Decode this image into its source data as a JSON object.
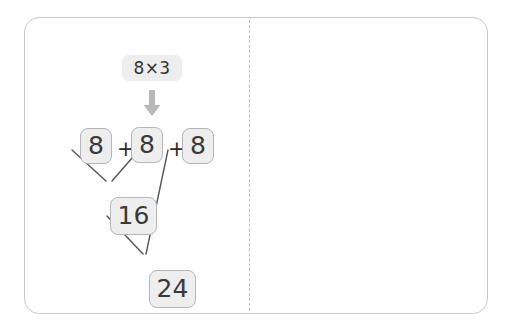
{
  "figure": {
    "divider_style": "dashed"
  },
  "colors": {
    "card_border": "#c9c9c9",
    "divider": "#bdbdbd",
    "chip_fill": "#eeeeee",
    "chip_border": "#b5b5b5",
    "badge_fill": "#eeeeee",
    "arrow": "#b9b9b9",
    "text": "#3a3a3a",
    "connector_line": "#555555",
    "page_background": "#ffffff"
  },
  "left_panel": {
    "name": "tree-diagram-panel",
    "badge": {
      "label": "8×3"
    },
    "arrow_icon": "arrow-down-icon",
    "row": {
      "terms": [
        "8",
        "8",
        "8"
      ],
      "operators": [
        "+",
        "+"
      ]
    },
    "intermediate": {
      "value": "16"
    },
    "result": {
      "value": "24"
    },
    "connectors": [
      {
        "from": "term-1",
        "to": "intermediate-16"
      },
      {
        "from": "term-2",
        "to": "intermediate-16"
      },
      {
        "from": "intermediate-16",
        "to": "result-24"
      },
      {
        "from": "term-3",
        "to": "result-24"
      }
    ]
  },
  "right_panel": {
    "name": "equation-steps-panel",
    "badge": {
      "label": "8×3"
    },
    "arrow_icon": "arrow-down-icon",
    "steps": [
      {
        "id": "step-expanded",
        "tokens": [
          {
            "kind": "chip",
            "text": "8"
          },
          {
            "kind": "op",
            "text": "+"
          },
          {
            "kind": "chip",
            "text": "8"
          },
          {
            "kind": "op",
            "text": "+"
          },
          {
            "kind": "chip",
            "text": "8"
          }
        ]
      },
      {
        "id": "step-grouped",
        "tokens": [
          {
            "kind": "op",
            "text": "="
          },
          {
            "kind": "op",
            "text": "("
          },
          {
            "kind": "chip",
            "text": "8"
          },
          {
            "kind": "op",
            "text": "×"
          },
          {
            "kind": "op",
            "text": "2"
          },
          {
            "kind": "op",
            "text": ")"
          },
          {
            "kind": "op",
            "text": "+"
          },
          {
            "kind": "chip",
            "text": "8"
          }
        ]
      },
      {
        "id": "step-partial-sum",
        "tokens": [
          {
            "kind": "op",
            "text": "="
          },
          {
            "kind": "chip",
            "text": "16"
          },
          {
            "kind": "op",
            "text": "+"
          },
          {
            "kind": "chip",
            "text": "8"
          }
        ]
      },
      {
        "id": "step-total",
        "tokens": [
          {
            "kind": "op",
            "text": "="
          },
          {
            "kind": "chip",
            "text": "24"
          }
        ]
      }
    ]
  }
}
